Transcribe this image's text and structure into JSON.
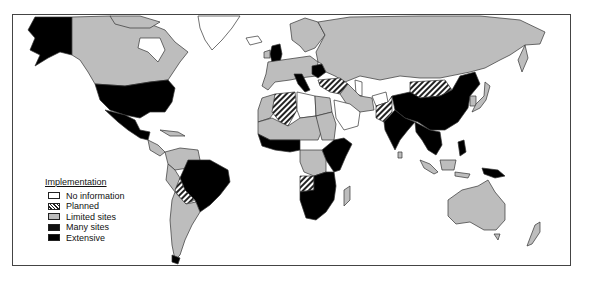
{
  "map": {
    "title": "Implementation map (world)",
    "frame": {
      "x": 12,
      "y": 14,
      "width": 559,
      "height": 252
    }
  },
  "legend": {
    "title": "Implementation",
    "items": [
      {
        "key": "no_information",
        "label": "No information",
        "color": "#ffffff",
        "pattern": "none"
      },
      {
        "key": "planned",
        "label": "Planned",
        "color": "#ffffff",
        "pattern": "diagonal-hatch"
      },
      {
        "key": "limited_sites",
        "label": "Limited sites",
        "color": "#bdbdbd",
        "pattern": "none"
      },
      {
        "key": "many_sites",
        "label": "Many sites",
        "color": "#111111",
        "pattern": "none"
      },
      {
        "key": "extensive",
        "label": "Extensive",
        "color": "#000000",
        "pattern": "none"
      }
    ]
  },
  "regions": [
    {
      "name": "Alaska",
      "category": "extensive"
    },
    {
      "name": "Canada",
      "category": "limited_sites"
    },
    {
      "name": "Greenland",
      "category": "no_information"
    },
    {
      "name": "United States",
      "category": "extensive"
    },
    {
      "name": "Mexico",
      "category": "extensive"
    },
    {
      "name": "Central America",
      "category": "limited_sites"
    },
    {
      "name": "Colombia/Venezuela",
      "category": "limited_sites"
    },
    {
      "name": "Brazil",
      "category": "extensive"
    },
    {
      "name": "Bolivia",
      "category": "planned"
    },
    {
      "name": "Argentina/Chile",
      "category": "limited_sites"
    },
    {
      "name": "Western Europe",
      "category": "limited_sites"
    },
    {
      "name": "United Kingdom",
      "category": "extensive"
    },
    {
      "name": "Italy",
      "category": "extensive"
    },
    {
      "name": "Romania/Balkans",
      "category": "extensive"
    },
    {
      "name": "Russia/USSR",
      "category": "limited_sites"
    },
    {
      "name": "Algeria",
      "category": "planned"
    },
    {
      "name": "Libya",
      "category": "no_information"
    },
    {
      "name": "Egypt",
      "category": "limited_sites"
    },
    {
      "name": "Turkey",
      "category": "planned"
    },
    {
      "name": "Saudi Arabia",
      "category": "no_information"
    },
    {
      "name": "Iran",
      "category": "limited_sites"
    },
    {
      "name": "Pakistan",
      "category": "planned"
    },
    {
      "name": "Mongolia",
      "category": "planned"
    },
    {
      "name": "China",
      "category": "extensive"
    },
    {
      "name": "India",
      "category": "extensive"
    },
    {
      "name": "Southeast Asia",
      "category": "extensive"
    },
    {
      "name": "Japan",
      "category": "limited_sites"
    },
    {
      "name": "West Africa",
      "category": "extensive"
    },
    {
      "name": "Sahel",
      "category": "limited_sites"
    },
    {
      "name": "Central Africa",
      "category": "limited_sites"
    },
    {
      "name": "East Africa",
      "category": "extensive"
    },
    {
      "name": "Angola",
      "category": "planned"
    },
    {
      "name": "Southern Africa",
      "category": "extensive"
    },
    {
      "name": "Madagascar",
      "category": "limited_sites"
    },
    {
      "name": "Indonesia",
      "category": "limited_sites"
    },
    {
      "name": "Papua New Guinea",
      "category": "extensive"
    },
    {
      "name": "Australia",
      "category": "limited_sites"
    },
    {
      "name": "New Zealand",
      "category": "limited_sites"
    }
  ]
}
